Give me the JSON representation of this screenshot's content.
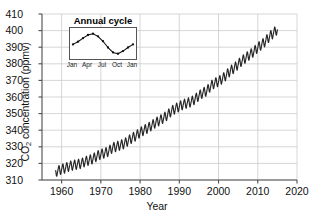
{
  "chart_data": {
    "type": "line",
    "title": "",
    "xlabel": "Year",
    "ylabel": "CO2 concentration (ppmv)",
    "ylabel_prefix": "CO",
    "ylabel_sub": "2",
    "ylabel_suffix": " concentration (ppmv)",
    "xlim": [
      1955,
      2020
    ],
    "ylim": [
      310,
      410
    ],
    "xticks": [
      1960,
      1970,
      1980,
      1990,
      2000,
      2010,
      2020
    ],
    "yticks": [
      310,
      320,
      330,
      340,
      350,
      360,
      370,
      380,
      390,
      400,
      410
    ],
    "grid": "both",
    "legend": "none",
    "series_name": "Mauna Loa monthly mean CO2",
    "line_color": "#262626",
    "grid_color": "#cccccc",
    "axis_color": "#4d4d4d",
    "annual_amplitude_ppm": 3.0,
    "x": [
      1958.5,
      1959,
      1960,
      1961,
      1962,
      1963,
      1964,
      1965,
      1966,
      1967,
      1968,
      1969,
      1970,
      1971,
      1972,
      1973,
      1974,
      1975,
      1976,
      1977,
      1978,
      1979,
      1980,
      1981,
      1982,
      1983,
      1984,
      1985,
      1986,
      1987,
      1988,
      1989,
      1990,
      1991,
      1992,
      1993,
      1994,
      1995,
      1996,
      1997,
      1998,
      1999,
      2000,
      2001,
      2002,
      2003,
      2004,
      2005,
      2006,
      2007,
      2008,
      2009,
      2010,
      2011,
      2012,
      2013,
      2014,
      2015
    ],
    "values": [
      315.0,
      315.5,
      316.6,
      317.3,
      318.4,
      319.0,
      319.5,
      320.0,
      321.2,
      322.0,
      322.9,
      324.5,
      325.6,
      326.3,
      327.4,
      329.6,
      330.2,
      331.1,
      332.0,
      333.8,
      335.4,
      336.8,
      338.7,
      340.1,
      341.4,
      343.0,
      344.6,
      346.0,
      347.4,
      349.2,
      351.6,
      353.1,
      354.4,
      355.6,
      356.4,
      357.1,
      358.8,
      360.8,
      362.6,
      363.7,
      366.7,
      368.4,
      369.5,
      371.1,
      373.3,
      375.8,
      377.5,
      379.8,
      381.9,
      383.8,
      385.6,
      387.4,
      389.9,
      391.6,
      393.8,
      396.5,
      398.6,
      400.8
    ]
  },
  "inset": {
    "title": "Annual cycle",
    "type": "line",
    "xticks": [
      "Jan",
      "Apr",
      "Jul",
      "Oct",
      "Jan"
    ],
    "xtick_positions": [
      0,
      3,
      6,
      9,
      12
    ],
    "months": [
      0,
      1,
      2,
      3,
      4,
      5,
      6,
      7,
      8,
      9,
      10,
      11,
      12
    ],
    "values": [
      -0.2,
      0.4,
      1.2,
      1.9,
      2.2,
      1.6,
      0.5,
      -0.9,
      -2.0,
      -2.3,
      -1.7,
      -0.9,
      -0.2
    ],
    "ylim": [
      -2.8,
      2.8
    ]
  }
}
